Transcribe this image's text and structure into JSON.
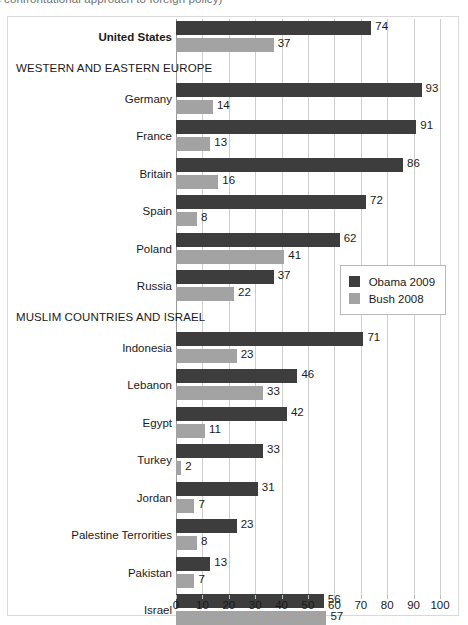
{
  "caption": {
    "text": "...less confrontational approach to foreign policy)"
  },
  "chart_data": {
    "type": "bar",
    "orientation": "horizontal",
    "title": "",
    "subtitle": "",
    "xlabel": "",
    "ylabel": "",
    "xlim": [
      0,
      100
    ],
    "xticks": [
      0,
      10,
      20,
      30,
      40,
      50,
      60,
      70,
      80,
      90,
      100
    ],
    "grid": true,
    "legend_position": "middle-right",
    "series": [
      {
        "name": "Obama 2009",
        "color": "#3d3d3d",
        "key": "obama"
      },
      {
        "name": "Bush 2008",
        "color": "#a3a3a3",
        "key": "bush"
      }
    ],
    "rows": [
      {
        "kind": "bar",
        "label": "United States",
        "bold": true,
        "obama": 74,
        "bush": 37
      },
      {
        "kind": "section",
        "label": "WESTERN AND EASTERN EUROPE"
      },
      {
        "kind": "bar",
        "label": "Germany",
        "bold": false,
        "obama": 93,
        "bush": 14
      },
      {
        "kind": "bar",
        "label": "France",
        "bold": false,
        "obama": 91,
        "bush": 13
      },
      {
        "kind": "bar",
        "label": "Britain",
        "bold": false,
        "obama": 86,
        "bush": 16
      },
      {
        "kind": "bar",
        "label": "Spain",
        "bold": false,
        "obama": 72,
        "bush": 8
      },
      {
        "kind": "bar",
        "label": "Poland",
        "bold": false,
        "obama": 62,
        "bush": 41
      },
      {
        "kind": "bar",
        "label": "Russia",
        "bold": false,
        "obama": 37,
        "bush": 22
      },
      {
        "kind": "section",
        "label": "MUSLIM COUNTRIES AND ISRAEL"
      },
      {
        "kind": "bar",
        "label": "Indonesia",
        "bold": false,
        "obama": 71,
        "bush": 23
      },
      {
        "kind": "bar",
        "label": "Lebanon",
        "bold": false,
        "obama": 46,
        "bush": 33
      },
      {
        "kind": "bar",
        "label": "Egypt",
        "bold": false,
        "obama": 42,
        "bush": 11
      },
      {
        "kind": "bar",
        "label": "Turkey",
        "bold": false,
        "obama": 33,
        "bush": 2
      },
      {
        "kind": "bar",
        "label": "Jordan",
        "bold": false,
        "obama": 31,
        "bush": 7
      },
      {
        "kind": "bar",
        "label": "Palestine Terrorities",
        "bold": false,
        "obama": 23,
        "bush": 8
      },
      {
        "kind": "bar",
        "label": "Pakistan",
        "bold": false,
        "obama": 13,
        "bush": 7
      },
      {
        "kind": "bar",
        "label": "Israel",
        "bold": false,
        "obama": 56,
        "bush": 57
      }
    ]
  }
}
